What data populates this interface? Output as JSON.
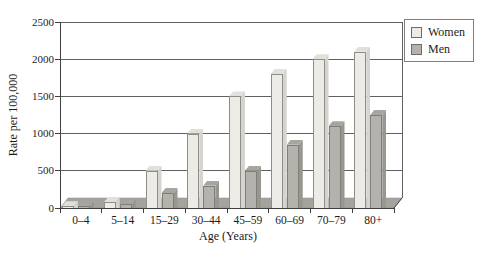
{
  "chart_data": {
    "type": "bar",
    "variant": "3d-clustered",
    "title": "",
    "xlabel": "Age (Years)",
    "ylabel": "Rate per 100,000",
    "categories": [
      "0–4",
      "5–14",
      "15–29",
      "30–44",
      "45–59",
      "60–69",
      "70–79",
      "80+"
    ],
    "series": [
      {
        "name": "Women",
        "values": [
          25,
          75,
          500,
          1000,
          1500,
          1800,
          2000,
          2100
        ],
        "colors": {
          "front": "#edebe6",
          "side": "#d6d4cf",
          "top": "#e2e0db",
          "dot": "#b9b7b2",
          "border": "#8f8d87"
        }
      },
      {
        "name": "Men",
        "values": [
          25,
          50,
          200,
          300,
          500,
          850,
          1100,
          1250
        ],
        "colors": {
          "front": "#b4b2ad",
          "side": "#98968f",
          "top": "#a7a5a0",
          "dot": "",
          "border": "#807e78"
        }
      }
    ],
    "ylim": [
      0,
      2500
    ],
    "ytick_interval": 500,
    "yticks": [
      "0",
      "500",
      "1000",
      "1500",
      "2000",
      "2500"
    ],
    "grid": true,
    "legend_position": "top-right"
  },
  "colors": {
    "floor": "#a5a39e",
    "floor_edge": "#8f8d88",
    "gridline": "#606060",
    "axis": "#3f3f3f",
    "text": "#1c1c1c",
    "background": "#ffffff"
  }
}
